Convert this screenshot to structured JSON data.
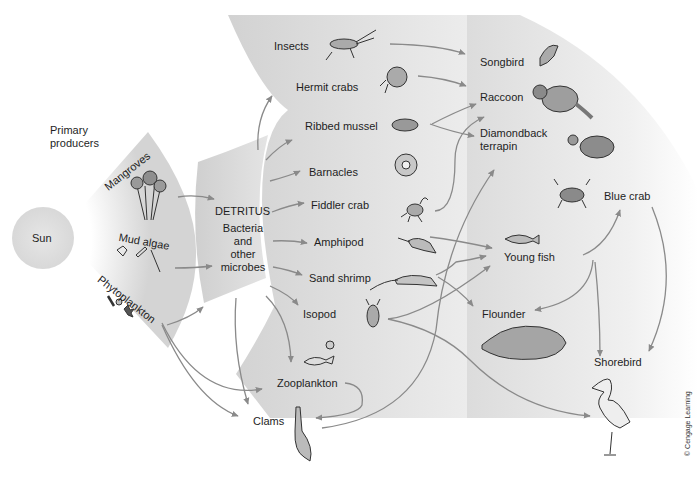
{
  "zones": {
    "producers": {
      "heading": "Primary producers",
      "heading_lines": [
        "Primary",
        "producers"
      ],
      "sun": "Sun",
      "items": [
        "Mangroves",
        "Mud algae",
        "Phytoplankton"
      ]
    },
    "detritus": {
      "title": "DETRITUS",
      "lines": [
        "Bacteria",
        "and",
        "other",
        "microbes"
      ]
    },
    "primary_consumers": {
      "items": [
        "Insects",
        "Hermit crabs",
        "Ribbed mussel",
        "Barnacles",
        "Fiddler crab",
        "Amphipod",
        "Sand shrimp",
        "Isopod",
        "Zooplankton",
        "Clams"
      ]
    },
    "higher_consumers": {
      "items": [
        "Songbird",
        "Raccoon",
        "Diamondback terrapin",
        "Blue crab",
        "Young fish",
        "Flounder",
        "Shorebird"
      ],
      "terrapin_lines": [
        "Diamondback",
        "terrapin"
      ]
    }
  },
  "icons": {
    "Insects": "grasshopper-icon",
    "Hermit crabs": "hermit-crab-icon",
    "Ribbed mussel": "mussel-icon",
    "Barnacles": "barnacle-icon",
    "Fiddler crab": "fiddler-crab-icon",
    "Amphipod": "amphipod-icon",
    "Sand shrimp": "shrimp-icon",
    "Isopod": "isopod-icon",
    "Zooplankton": "zooplankton-icon",
    "Clams": "clam-icon",
    "Songbird": "songbird-icon",
    "Raccoon": "raccoon-icon",
    "Diamondback terrapin": "turtle-icon",
    "Blue crab": "blue-crab-icon",
    "Young fish": "fish-icon",
    "Flounder": "flounder-icon",
    "Shorebird": "heron-icon"
  },
  "links": [
    [
      "Mangroves",
      "DETRITUS"
    ],
    [
      "Mud algae",
      "DETRITUS"
    ],
    [
      "Phytoplankton",
      "DETRITUS"
    ],
    [
      "Phytoplankton",
      "Zooplankton"
    ],
    [
      "Phytoplankton",
      "Clams"
    ],
    [
      "DETRITUS",
      "Hermit crabs"
    ],
    [
      "DETRITUS",
      "Ribbed mussel"
    ],
    [
      "DETRITUS",
      "Barnacles"
    ],
    [
      "DETRITUS",
      "Fiddler crab"
    ],
    [
      "DETRITUS",
      "Amphipod"
    ],
    [
      "DETRITUS",
      "Sand shrimp"
    ],
    [
      "DETRITUS",
      "Isopod"
    ],
    [
      "DETRITUS",
      "Zooplankton"
    ],
    [
      "DETRITUS",
      "Clams"
    ],
    [
      "Zooplankton",
      "Clams"
    ],
    [
      "Insects",
      "Songbird"
    ],
    [
      "Hermit crabs",
      "Raccoon"
    ],
    [
      "Ribbed mussel",
      "Raccoon"
    ],
    [
      "Ribbed mussel",
      "Diamondback terrapin"
    ],
    [
      "Fiddler crab",
      "Raccoon"
    ],
    [
      "Clams",
      "Diamondback terrapin"
    ],
    [
      "Amphipod",
      "Young fish"
    ],
    [
      "Sand shrimp",
      "Young fish"
    ],
    [
      "Sand shrimp",
      "Flounder"
    ],
    [
      "Isopod",
      "Young fish"
    ],
    [
      "Isopod",
      "Shorebird"
    ],
    [
      "Young fish",
      "Blue crab"
    ],
    [
      "Young fish",
      "Flounder"
    ],
    [
      "Young fish",
      "Shorebird"
    ],
    [
      "Blue crab",
      "Shorebird"
    ]
  ],
  "colors": {
    "band": "#d6d6d6",
    "band_light": "#eeeeee",
    "arrow": "#8a8a8a",
    "sun": "#dcdcdc"
  },
  "credit": "© Cengage Learning"
}
